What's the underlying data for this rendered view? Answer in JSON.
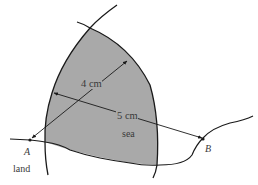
{
  "diagram": {
    "type": "locus-construction",
    "labels": {
      "point_a": "A",
      "point_b": "B",
      "dist_a": "4 cm",
      "dist_b": "5 cm",
      "sea": "sea",
      "land": "land"
    },
    "colors": {
      "shade": "#a9a9a9",
      "line": "#1a1a1a",
      "text": "#3a3a3a"
    }
  }
}
